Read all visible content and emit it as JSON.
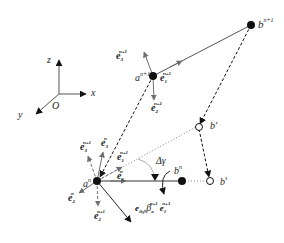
{
  "figure": {
    "type": "geometric-vector-diagram",
    "axes": {
      "x_label": "x",
      "y_label": "y",
      "z_label": "z",
      "origin_label": "O"
    },
    "points": {
      "b_n1": {
        "base": "b",
        "sup": "n+1"
      },
      "a_n1": {
        "base": "a",
        "sup": "n+1"
      },
      "a_n": {
        "base": "a",
        "sup": "n"
      },
      "b_n": {
        "base": "b",
        "sup": "n"
      },
      "b_prime": {
        "base": "b′",
        "sup": ""
      },
      "b_s": {
        "base": "b",
        "sup": "s"
      }
    },
    "vectors": {
      "e1_n1_top": {
        "base": "e",
        "sub": "1",
        "sup": "n+1"
      },
      "e2_n1_top": {
        "base": "e",
        "sub": "2",
        "sup": "n+1"
      },
      "e3_n1_top": {
        "base": "e",
        "sub": "3",
        "sup": "n+1"
      },
      "e1_n_low": {
        "base": "e",
        "sub": "1",
        "sup": "n"
      },
      "e1_n1_low": {
        "base": "e",
        "sub": "1",
        "sup": "n+1"
      },
      "e2_n1_low": {
        "base": "e",
        "sub": "2",
        "sup": "n+1"
      },
      "e2_n_low": {
        "base": "e",
        "sub": "2",
        "sup": "n"
      },
      "e3_n_low": {
        "base": "e",
        "sub": "3",
        "sup": "n"
      },
      "e3_n1_low": {
        "base": "e",
        "sub": "3",
        "sup": "n+1"
      }
    },
    "angle_label": "Δγ",
    "rotation_expr": {
      "e": "e",
      "e_sub": "Δγ",
      "comma": ",",
      "beta": "β",
      "beta_sub": "a",
      "beta_sup": "n+1",
      "e2": "e",
      "e2_sub": "1",
      "e2_sup": "n+1"
    },
    "colors": {
      "black": "#111111",
      "gray": "#6e6e6e",
      "dotted": "#888888"
    }
  }
}
